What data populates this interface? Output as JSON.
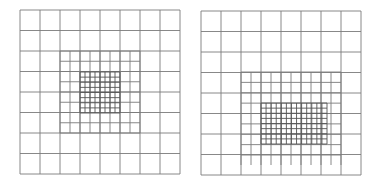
{
  "style": {
    "line_color": "#7a7a7a",
    "fine_line_color": "#555555",
    "background": "#ffffff"
  },
  "grids": [
    {
      "name": "left-mesh",
      "coarse": {
        "x0": 20,
        "y0": 10,
        "x1": 180,
        "y1": 174,
        "nx": 8,
        "ny": 8
      },
      "mid": {
        "x0": 60,
        "y0": 51,
        "x1": 140,
        "y1": 133,
        "nx": 8,
        "ny": 8,
        "vext_y1": 133
      },
      "fine": {
        "x0": 80,
        "y0": 72,
        "x1": 120,
        "y1": 113,
        "nx": 8,
        "ny": 8
      }
    },
    {
      "name": "right-mesh",
      "coarse": {
        "x0": 201,
        "y0": 11,
        "x1": 361,
        "y1": 175,
        "nx": 8,
        "ny": 8
      },
      "mid": {
        "x0": 241,
        "y0": 72,
        "x1": 341,
        "y1": 155,
        "nx": 10,
        "ny": 8,
        "vext_y1": 165
      },
      "fine": {
        "x0": 261,
        "y0": 103,
        "x1": 327,
        "y1": 144,
        "nx": 13,
        "ny": 8
      }
    }
  ]
}
